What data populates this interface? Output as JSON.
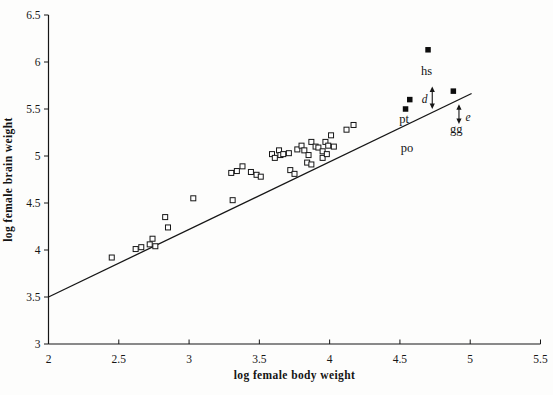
{
  "chart_data": {
    "type": "scatter",
    "title": "",
    "xlabel": "log female body weight",
    "ylabel": "log female brain weight",
    "xlim": [
      2,
      5.5
    ],
    "ylim": [
      3,
      6.5
    ],
    "x_ticks": [
      2,
      2.5,
      3,
      3.5,
      4,
      4.5,
      5,
      5.5
    ],
    "y_ticks": [
      3,
      3.5,
      4,
      4.5,
      5,
      5.5,
      6,
      6.5
    ],
    "grid": false,
    "legend": null,
    "series": [
      {
        "name": "anthropoid-species",
        "marker": "open-square",
        "points": [
          [
            2.45,
            3.92
          ],
          [
            2.62,
            4.01
          ],
          [
            2.66,
            4.03
          ],
          [
            2.72,
            4.06
          ],
          [
            2.74,
            4.12
          ],
          [
            2.76,
            4.04
          ],
          [
            2.83,
            4.35
          ],
          [
            2.85,
            4.24
          ],
          [
            3.03,
            4.55
          ],
          [
            3.3,
            4.82
          ],
          [
            3.31,
            4.53
          ],
          [
            3.34,
            4.84
          ],
          [
            3.38,
            4.89
          ],
          [
            3.44,
            4.83
          ],
          [
            3.48,
            4.8
          ],
          [
            3.51,
            4.78
          ],
          [
            3.59,
            5.02
          ],
          [
            3.61,
            4.98
          ],
          [
            3.64,
            5.06
          ],
          [
            3.65,
            5.01
          ],
          [
            3.67,
            5.02
          ],
          [
            3.71,
            5.03
          ],
          [
            3.72,
            4.85
          ],
          [
            3.75,
            4.81
          ],
          [
            3.77,
            5.07
          ],
          [
            3.8,
            5.11
          ],
          [
            3.82,
            5.06
          ],
          [
            3.84,
            4.93
          ],
          [
            3.85,
            5.01
          ],
          [
            3.87,
            4.91
          ],
          [
            3.87,
            5.15
          ],
          [
            3.9,
            5.1
          ],
          [
            3.92,
            5.09
          ],
          [
            3.95,
            5.05
          ],
          [
            3.95,
            4.98
          ],
          [
            3.97,
            5.15
          ],
          [
            3.98,
            5.02
          ],
          [
            3.99,
            5.11
          ],
          [
            4.01,
            5.22
          ],
          [
            4.03,
            5.1
          ],
          [
            4.12,
            5.28
          ],
          [
            4.17,
            5.33
          ]
        ]
      },
      {
        "name": "great-apes-and-human",
        "marker": "filled-square",
        "points": [
          [
            4.54,
            5.5
          ],
          [
            4.57,
            5.6
          ],
          [
            4.7,
            6.13
          ],
          [
            4.88,
            5.69
          ]
        ]
      }
    ],
    "regression_line": {
      "x1": 2.0,
      "y1": 3.5,
      "x2": 5.01,
      "y2": 5.665
    },
    "point_labels": [
      {
        "text": "hs",
        "x": 4.69,
        "y": 5.9
      },
      {
        "text": "pt",
        "x": 4.53,
        "y": 5.39
      },
      {
        "text": "po",
        "x": 4.55,
        "y": 5.09
      },
      {
        "text": "gg",
        "x": 4.9,
        "y": 5.29
      }
    ],
    "residual_arrows": [
      {
        "label": "d",
        "label_x": 4.675,
        "label_y": 5.61,
        "x": 4.73,
        "y_top": 5.74,
        "y_bottom": 5.5
      },
      {
        "label": "e",
        "label_x": 4.985,
        "label_y": 5.41,
        "x": 4.92,
        "y_top": 5.55,
        "y_bottom": 5.34
      }
    ]
  }
}
